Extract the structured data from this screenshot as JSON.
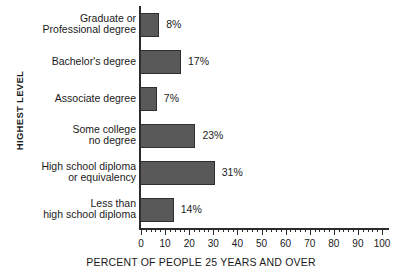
{
  "chart_data": {
    "type": "bar",
    "orientation": "horizontal",
    "title": "",
    "xlabel": "PERCENT OF PEOPLE 25 YEARS AND OVER",
    "ylabel": "HIGHEST LEVEL",
    "categories": [
      "Graduate or Professional degree",
      "Bachelor's degree",
      "Associate degree",
      "Some college no degree",
      "High school diploma or equivalency",
      "Less than high school diploma"
    ],
    "category_lines": [
      [
        "Graduate or",
        "Professional degree"
      ],
      [
        "Bachelor's degree"
      ],
      [
        "Associate degree"
      ],
      [
        "Some college",
        "no degree"
      ],
      [
        "High school diploma",
        "or equivalency"
      ],
      [
        "Less than",
        "high school diploma"
      ]
    ],
    "values": [
      8,
      17,
      7,
      23,
      31,
      14
    ],
    "value_labels": [
      "8%",
      "17%",
      "7%",
      "23%",
      "31%",
      "14%"
    ],
    "xlim": [
      0,
      100
    ],
    "xticks": [
      0,
      10,
      20,
      30,
      40,
      50,
      60,
      70,
      80,
      90,
      100
    ],
    "xtick_labels": [
      "0",
      "10",
      "20",
      "30",
      "40",
      "50",
      "60",
      "70",
      "80",
      "90",
      "100"
    ],
    "minor_tick_step": 2,
    "grid": false,
    "legend": false,
    "bar_color": "#595959",
    "bar_border_color": "#2f2f2f",
    "axis_color": "#2b2b2b",
    "background_color": "#ffffff"
  }
}
